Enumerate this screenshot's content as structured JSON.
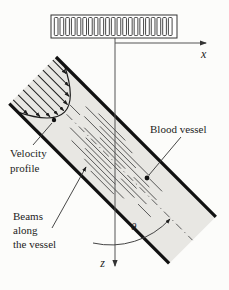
{
  "figure": {
    "background": "#fcfcfa",
    "ink": "#1c1c1c",
    "vessel_fill": "#e8e7e3",
    "axes": {
      "x_label": "x",
      "z_label": "z"
    },
    "angle_label": "θ",
    "labels": {
      "blood_vessel": "Blood vessel",
      "velocity_profile": [
        "Velocity",
        "profile"
      ],
      "beams": [
        "Beams",
        "along",
        "the vessel"
      ]
    },
    "transducer": {
      "element_count": 21
    },
    "velocity_profile": {
      "arrow_positions": [
        4.5,
        11.5,
        18.5,
        25.5,
        32.5,
        39.5,
        46.5,
        53.5,
        60.5
      ],
      "wall_u": 12,
      "vertex_u": 45,
      "half_width": 33
    },
    "beam_segments": [
      [
        10,
        70,
        108
      ],
      [
        14,
        56,
        122
      ],
      [
        18,
        80,
        150
      ],
      [
        20,
        152,
        170
      ],
      [
        22,
        62,
        135
      ],
      [
        24,
        44,
        58
      ],
      [
        26,
        88,
        158
      ],
      [
        30,
        70,
        128
      ],
      [
        30,
        140,
        172
      ],
      [
        36,
        78,
        150
      ],
      [
        40,
        60,
        118
      ],
      [
        40,
        132,
        168
      ],
      [
        44,
        85,
        155
      ],
      [
        46,
        162,
        180
      ],
      [
        48,
        70,
        132
      ],
      [
        52,
        92,
        148
      ],
      [
        56,
        105,
        138
      ]
    ]
  }
}
